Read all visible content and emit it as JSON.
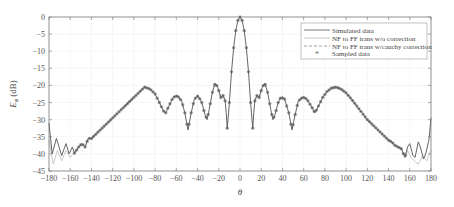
{
  "chart_data": {
    "type": "line",
    "title": "",
    "xlabel": "θ",
    "ylabel": "E_φ (dB)",
    "ylabel_main": "E",
    "ylabel_sub": "φ",
    "ylabel_unit": " (dB)",
    "xlim": [
      -180,
      180
    ],
    "ylim": [
      -45,
      0
    ],
    "grid": true,
    "legend_position": "upper right",
    "x_ticks": [
      -180,
      -160,
      -140,
      -120,
      -100,
      -80,
      -60,
      -40,
      -20,
      0,
      20,
      40,
      60,
      80,
      100,
      120,
      140,
      160,
      180
    ],
    "x_tick_labels": [
      "−180",
      "−160",
      "−140",
      "−120",
      "−100",
      "−80",
      "−60",
      "−40",
      "−20",
      "0",
      "20",
      "40",
      "60",
      "80",
      "100",
      "120",
      "140",
      "160",
      "180"
    ],
    "y_ticks": [
      0,
      -5,
      -10,
      -15,
      -20,
      -25,
      -30,
      -35,
      -40,
      -45
    ],
    "y_tick_labels": [
      "0",
      "−5",
      "−10",
      "−15",
      "−20",
      "−25",
      "−30",
      "−35",
      "−40",
      "−45"
    ],
    "legend": [
      {
        "label": "Simulated data",
        "style": "solid",
        "color": "#555555"
      },
      {
        "label": "NF to FF trans w/o correction",
        "style": "solid",
        "color": "#bbbbbb"
      },
      {
        "label": "NF to FF trans w/cauchy correction",
        "style": "dashed",
        "color": "#888888"
      },
      {
        "label": "Sampled data",
        "style": "marker",
        "color": "#666666",
        "marker": "*"
      }
    ],
    "series": [
      {
        "name": "Simulated data",
        "color": "#555555",
        "x": [
          -180,
          -177,
          -173,
          -168,
          -164,
          -161,
          -158,
          -156,
          -152,
          -149,
          -146,
          -143,
          -140,
          -135,
          -130,
          -125,
          -120,
          -115,
          -110,
          -105,
          -100,
          -95,
          -90,
          -85,
          -80,
          -76,
          -72,
          -70,
          -67,
          -63,
          -59,
          -55,
          -52,
          -49,
          -46,
          -43,
          -39.5,
          -36,
          -33,
          -31,
          -29,
          -26,
          -23.5,
          -21,
          -18,
          -16,
          -14,
          -13,
          -12,
          -10,
          -8,
          -6,
          -4,
          -2,
          0,
          2,
          4,
          6,
          8,
          10,
          12,
          13,
          14,
          16,
          18,
          21,
          23.5,
          26,
          29,
          31,
          33,
          36,
          38.6,
          42,
          46,
          49,
          52,
          55,
          59.4,
          63,
          67,
          70.7,
          74,
          78,
          82,
          86,
          90.5,
          95,
          100,
          105,
          110,
          115,
          120,
          125,
          130,
          135,
          140,
          143,
          146,
          149,
          152,
          155.5,
          158,
          160,
          163,
          165,
          168,
          170,
          173,
          175,
          178,
          180
        ],
        "y": [
          -31,
          -40,
          -35.5,
          -40.5,
          -37,
          -40,
          -38,
          -39.8,
          -38,
          -37,
          -38,
          -35.5,
          -35.5,
          -34,
          -32.5,
          -31,
          -29.5,
          -28,
          -26.5,
          -25,
          -23.5,
          -22,
          -20.5,
          -21,
          -22.5,
          -25,
          -27.5,
          -28,
          -26,
          -23.5,
          -23,
          -24.5,
          -28,
          -33,
          -28,
          -24,
          -23,
          -25,
          -28.5,
          -30,
          -27,
          -22,
          -19.3,
          -20.5,
          -23.5,
          -23,
          -24.5,
          -28,
          -32.5,
          -25,
          -16,
          -9,
          -4,
          -1,
          0,
          -1,
          -4,
          -9,
          -16,
          -25,
          -32.5,
          -28,
          -24.5,
          -23,
          -23.5,
          -20.5,
          -19.3,
          -22,
          -27,
          -30,
          -28.5,
          -25,
          -23.4,
          -24,
          -28,
          -33,
          -28.5,
          -24.5,
          -23.4,
          -24,
          -26,
          -28,
          -26,
          -23.5,
          -21.8,
          -20.8,
          -20.5,
          -21,
          -22.2,
          -24,
          -26,
          -28,
          -30,
          -31.5,
          -33,
          -34.5,
          -36,
          -36.5,
          -37.5,
          -38,
          -38.5,
          -41,
          -38,
          -37,
          -40.5,
          -41,
          -36.5,
          -38,
          -41.5,
          -40,
          -36,
          -29.5
        ]
      },
      {
        "name": "NF to FF trans w/o correction",
        "color": "#bbbbbb",
        "x": [
          -180,
          -176,
          -172,
          -168,
          -164,
          -160,
          -156,
          -152,
          -149,
          -146,
          -143,
          -140,
          140,
          143,
          146,
          149,
          152,
          155.5,
          158,
          161,
          164,
          168,
          172,
          176,
          180
        ],
        "y": [
          -36,
          -43,
          -39,
          -42,
          -39,
          -41,
          -39.5,
          -38,
          -37,
          -38,
          -35.5,
          -35.5,
          -36,
          -36.5,
          -37.5,
          -38,
          -38.5,
          -41,
          -39,
          -41,
          -42,
          -43,
          -40.5,
          -42,
          -39
        ]
      },
      {
        "name": "NF to FF trans w/cauchy correction",
        "color": "#888888",
        "x": [
          -20,
          -18,
          -16,
          -14,
          14,
          16,
          18,
          20
        ],
        "y": [
          -21.5,
          -24,
          -22.5,
          -24,
          -24,
          -22.5,
          -24,
          -21.5
        ]
      },
      {
        "name": "Sampled data",
        "color": "#666666",
        "marker": "*",
        "x_range": [
          -156,
          156
        ],
        "x_step": 2
      }
    ]
  }
}
